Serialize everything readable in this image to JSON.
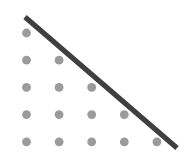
{
  "figure": {
    "name": "triangular-dot-array-with-diagonal-line",
    "width": 194,
    "height": 168,
    "background_color": "#ffffff",
    "title": "",
    "caption": "",
    "labels": []
  },
  "chart_data": {
    "type": "scatter",
    "title": "",
    "subtitle": "",
    "xlabel": "",
    "ylabel": "",
    "xlim": [
      0,
      194
    ],
    "ylim": [
      168,
      0
    ],
    "grid": false,
    "legend": null,
    "axes_visible": false,
    "tick_labels": {
      "x": [],
      "y": []
    },
    "annotations": [],
    "row_counts": [
      1,
      2,
      3,
      4,
      5
    ],
    "total_points": 15,
    "grid_spacing": {
      "x": 32.6,
      "y": 27.2
    },
    "point_style": {
      "marker": "circle",
      "color": "#9b9b9b",
      "radius": 4.4,
      "opacity": 1
    },
    "points": [
      {
        "row": 1,
        "col": 1,
        "x": 26.5,
        "y": 33.0
      },
      {
        "row": 2,
        "col": 1,
        "x": 26.5,
        "y": 60.2
      },
      {
        "row": 2,
        "col": 2,
        "x": 59.1,
        "y": 60.2
      },
      {
        "row": 3,
        "col": 1,
        "x": 26.5,
        "y": 87.4
      },
      {
        "row": 3,
        "col": 2,
        "x": 59.1,
        "y": 87.4
      },
      {
        "row": 3,
        "col": 3,
        "x": 91.7,
        "y": 87.4
      },
      {
        "row": 4,
        "col": 1,
        "x": 26.5,
        "y": 114.6
      },
      {
        "row": 4,
        "col": 2,
        "x": 59.1,
        "y": 114.6
      },
      {
        "row": 4,
        "col": 3,
        "x": 91.7,
        "y": 114.6
      },
      {
        "row": 4,
        "col": 4,
        "x": 124.3,
        "y": 114.6
      },
      {
        "row": 5,
        "col": 1,
        "x": 26.5,
        "y": 141.8
      },
      {
        "row": 5,
        "col": 2,
        "x": 59.1,
        "y": 141.8
      },
      {
        "row": 5,
        "col": 3,
        "x": 91.7,
        "y": 141.8
      },
      {
        "row": 5,
        "col": 4,
        "x": 124.3,
        "y": 141.8
      },
      {
        "row": 5,
        "col": 5,
        "x": 156.9,
        "y": 141.8
      }
    ],
    "series": [
      {
        "name": "dot-array",
        "type": "scatter",
        "color": "#9b9b9b",
        "values": [
          1,
          2,
          3,
          4,
          5
        ]
      },
      {
        "name": "hypotenuse",
        "type": "line",
        "color": "#3f3f3f",
        "width": 5.2,
        "x": [
          25.0,
          177.0
        ],
        "y": [
          17.0,
          148.0
        ]
      }
    ]
  }
}
